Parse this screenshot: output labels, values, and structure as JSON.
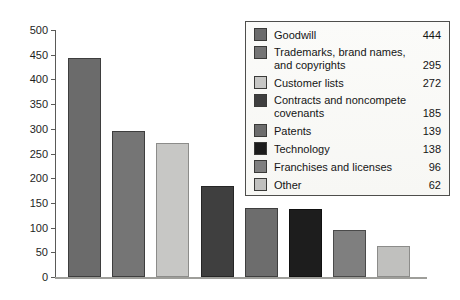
{
  "figure": {
    "kind": "scanned textbook bar chart of intangible asset categories",
    "background_top_band": "#c3c3bf",
    "background_main": "#fdfdfb",
    "axis_color": "#5a5a58",
    "baseline_color": "#9e9e9a",
    "text_color": "#1e1e1e",
    "legend_border_color": "#4e4e4c",
    "legend_background": "#fbfbf9"
  },
  "chart_data": {
    "type": "bar",
    "title": "",
    "xlabel": "",
    "ylabel": "",
    "categories": [
      "Goodwill",
      "Trademarks, brand names, and copyrights",
      "Customer lists",
      "Contracts and noncompete covenants",
      "Patents",
      "Technology",
      "Franchises and licenses",
      "Other"
    ],
    "values": [
      444,
      295,
      272,
      185,
      139,
      138,
      96,
      62
    ],
    "bar_colors": [
      "#6b6b6b",
      "#757575",
      "#c7c7c5",
      "#3f3f3f",
      "#6d6d6d",
      "#1d1d1d",
      "#7f7f7f",
      "#c0c0be"
    ],
    "bar_borders": [
      "#3e3e3e",
      "#3e3e3e",
      "#8c8c8a",
      "#262626",
      "#3e3e3e",
      "#111111",
      "#4a4a4a",
      "#8c8c8a"
    ],
    "ylim": [
      0,
      500
    ],
    "y_ticks": [
      0,
      50,
      100,
      150,
      200,
      250,
      300,
      350,
      400,
      450,
      500
    ],
    "grid": false,
    "x_tick_labels": [],
    "legend_position": "top-right",
    "legend_entries": [
      {
        "label": "Goodwill",
        "value": "444"
      },
      {
        "label": "Trademarks, brand names, and copyrights",
        "value": "295"
      },
      {
        "label": "Customer lists",
        "value": "272"
      },
      {
        "label": "Contracts and noncompete covenants",
        "value": "185"
      },
      {
        "label": "Patents",
        "value": "139"
      },
      {
        "label": "Technology",
        "value": "138"
      },
      {
        "label": "Franchises and licenses",
        "value": "96"
      },
      {
        "label": "Other",
        "value": "62"
      }
    ]
  }
}
